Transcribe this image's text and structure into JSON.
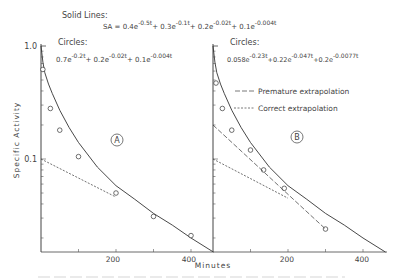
{
  "chart_data": {
    "type": "line",
    "title": "",
    "xlabel": "Minutes",
    "ylabel": "Specific Activity",
    "yscale": "log",
    "ylim": [
      0.015,
      1.0
    ],
    "y_ticks": [
      {
        "value": 1.0,
        "label": "1.0"
      },
      {
        "value": 0.1,
        "label": "0.1"
      }
    ],
    "x_ticks": [
      100,
      200,
      300,
      400
    ],
    "x_tick_labels": [
      "200",
      "400"
    ],
    "grid": false,
    "equations": {
      "solid_header": "Solid Lines:",
      "solid": "SA = 0.4e^-0.5t + 0.3e^-0.1t + 0.2e^-0.02t + 0.1e^-0.004t",
      "circles_header": "Circles:",
      "circles_A": "0.7e^-0.2t + 0.2e^-0.02t + 0.1e^-0.004t",
      "circles_B": "0.058e^-0.23t + 0.22e^-0.047t + 0.2e^-0.0077t"
    },
    "panels": [
      {
        "label": "A",
        "xlim": [
          0,
          460
        ],
        "series": [
          {
            "name": "Solid Lines",
            "style": "solid",
            "x": [
              0,
              5,
              10,
              20,
              30,
              50,
              75,
              100,
              150,
              200,
              250,
              300,
              350,
              400,
              460
            ],
            "y": [
              1.0,
              0.72,
              0.58,
              0.46,
              0.38,
              0.27,
              0.19,
              0.14,
              0.085,
              0.058,
              0.044,
              0.033,
              0.026,
              0.02,
              0.015
            ]
          },
          {
            "name": "Circles",
            "style": "marker",
            "x": [
              5,
              25,
              50,
              100,
              200,
              300,
              400
            ],
            "y": [
              0.62,
              0.28,
              0.18,
              0.105,
              0.05,
              0.031,
              0.021
            ]
          },
          {
            "name": "Correct extrapolation",
            "style": "short-dash",
            "x": [
              0,
              200
            ],
            "y": [
              0.1,
              0.046
            ]
          }
        ]
      },
      {
        "label": "B",
        "xlim": [
          0,
          460
        ],
        "series": [
          {
            "name": "Solid Lines",
            "style": "solid",
            "x": [
              0,
              5,
              10,
              20,
              30,
              50,
              75,
              100,
              150,
              200,
              250,
              300,
              350,
              400,
              460
            ],
            "y": [
              1.0,
              0.72,
              0.58,
              0.46,
              0.38,
              0.27,
              0.19,
              0.14,
              0.085,
              0.058,
              0.044,
              0.033,
              0.026,
              0.02,
              0.015
            ]
          },
          {
            "name": "Circles",
            "style": "marker",
            "x": [
              8,
              25,
              50,
              100,
              135,
              190,
              300
            ],
            "y": [
              0.47,
              0.28,
              0.18,
              0.12,
              0.08,
              0.055,
              0.024
            ]
          },
          {
            "name": "Premature extrapolation",
            "style": "long-dash",
            "x": [
              0,
              300
            ],
            "y": [
              0.2,
              0.024
            ]
          },
          {
            "name": "Correct extrapolation",
            "style": "short-dash",
            "x": [
              0,
              200
            ],
            "y": [
              0.1,
              0.045
            ]
          }
        ]
      }
    ],
    "legend": [
      {
        "label": "Premature extrapolation",
        "style": "long-dash"
      },
      {
        "label": "Correct extrapolation",
        "style": "short-dash"
      }
    ]
  }
}
